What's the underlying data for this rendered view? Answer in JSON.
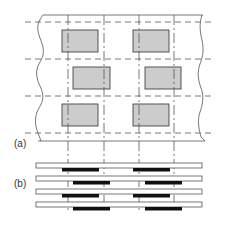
{
  "labels": {
    "part_a": "(a)",
    "part_b": "(b)"
  },
  "colors": {
    "line": "#555555",
    "block_fill": "#cccccc",
    "block_stroke": "#444444",
    "bar": "#111111",
    "background": "#ffffff"
  },
  "part_a": {
    "description": "Staggered grid of gray rectangular blocks between wavy break lines, with dashed horizontal and dash-dot vertical guide lines",
    "rows": 3,
    "blocks_per_row": 2,
    "stagger": "middle row offset right"
  },
  "part_b": {
    "description": "Four horizontal strips each with two black bars, alternating offsets",
    "strips": 4,
    "bars_per_strip": 2
  }
}
